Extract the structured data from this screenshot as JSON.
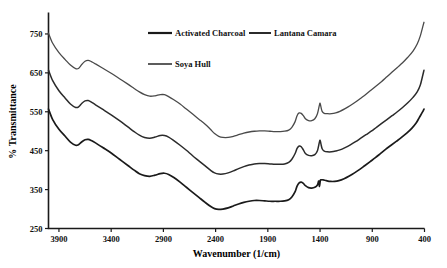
{
  "chart_data": {
    "type": "line",
    "title": "",
    "xlabel": "Wavenumber (1/cm)",
    "ylabel": "% Transmittance",
    "xlim": [
      4000,
      400
    ],
    "ylim": [
      250,
      800
    ],
    "x_ticks": [
      3900,
      3400,
      2900,
      2400,
      1900,
      1400,
      900,
      400
    ],
    "y_ticks": [
      250,
      350,
      450,
      550,
      650,
      750
    ],
    "grid": false,
    "x_axis_direction": "descending",
    "legend_position": "top-center",
    "series": [
      {
        "name": "Activated Charcoal",
        "color": "#1a1a1a",
        "stroke_width": 1.7,
        "points": [
          [
            4000,
            557
          ],
          [
            3960,
            530
          ],
          [
            3900,
            505
          ],
          [
            3840,
            487
          ],
          [
            3790,
            472
          ],
          [
            3740,
            464
          ],
          [
            3710,
            466
          ],
          [
            3680,
            473
          ],
          [
            3650,
            478
          ],
          [
            3620,
            479
          ],
          [
            3590,
            476
          ],
          [
            3550,
            470
          ],
          [
            3480,
            458
          ],
          [
            3400,
            444
          ],
          [
            3320,
            428
          ],
          [
            3240,
            412
          ],
          [
            3180,
            400
          ],
          [
            3130,
            391
          ],
          [
            3080,
            386
          ],
          [
            3030,
            384
          ],
          [
            2980,
            387
          ],
          [
            2930,
            391
          ],
          [
            2890,
            392
          ],
          [
            2850,
            389
          ],
          [
            2800,
            381
          ],
          [
            2740,
            369
          ],
          [
            2680,
            356
          ],
          [
            2620,
            343
          ],
          [
            2560,
            330
          ],
          [
            2500,
            317
          ],
          [
            2450,
            307
          ],
          [
            2410,
            301
          ],
          [
            2370,
            299
          ],
          [
            2330,
            300
          ],
          [
            2280,
            303
          ],
          [
            2230,
            308
          ],
          [
            2180,
            313
          ],
          [
            2130,
            317
          ],
          [
            2080,
            320
          ],
          [
            2030,
            322
          ],
          [
            1980,
            322
          ],
          [
            1930,
            321
          ],
          [
            1880,
            320
          ],
          [
            1830,
            320
          ],
          [
            1780,
            320
          ],
          [
            1740,
            321
          ],
          [
            1700,
            324
          ],
          [
            1670,
            331
          ],
          [
            1640,
            344
          ],
          [
            1620,
            359
          ],
          [
            1600,
            367
          ],
          [
            1580,
            369
          ],
          [
            1560,
            366
          ],
          [
            1540,
            360
          ],
          [
            1510,
            355
          ],
          [
            1480,
            354
          ],
          [
            1450,
            356
          ],
          [
            1425,
            362
          ],
          [
            1412,
            372
          ],
          [
            1405,
            358
          ],
          [
            1398,
            373
          ],
          [
            1390,
            375
          ],
          [
            1370,
            375
          ],
          [
            1340,
            373
          ],
          [
            1300,
            371
          ],
          [
            1260,
            371
          ],
          [
            1220,
            373
          ],
          [
            1170,
            378
          ],
          [
            1120,
            385
          ],
          [
            1070,
            393
          ],
          [
            1020,
            402
          ],
          [
            970,
            412
          ],
          [
            920,
            422
          ],
          [
            870,
            432
          ],
          [
            820,
            443
          ],
          [
            770,
            454
          ],
          [
            720,
            464
          ],
          [
            670,
            474
          ],
          [
            620,
            484
          ],
          [
            570,
            495
          ],
          [
            520,
            508
          ],
          [
            480,
            521
          ],
          [
            450,
            535
          ],
          [
            420,
            549
          ],
          [
            405,
            557
          ]
        ]
      },
      {
        "name": "Lantana Camara",
        "color": "#2b2b2b",
        "stroke_width": 1.5,
        "points": [
          [
            4000,
            657
          ],
          [
            3960,
            630
          ],
          [
            3900,
            604
          ],
          [
            3840,
            585
          ],
          [
            3790,
            570
          ],
          [
            3740,
            561
          ],
          [
            3710,
            563
          ],
          [
            3680,
            572
          ],
          [
            3650,
            578
          ],
          [
            3620,
            579
          ],
          [
            3590,
            575
          ],
          [
            3550,
            568
          ],
          [
            3480,
            556
          ],
          [
            3400,
            542
          ],
          [
            3320,
            527
          ],
          [
            3240,
            511
          ],
          [
            3180,
            499
          ],
          [
            3130,
            490
          ],
          [
            3080,
            484
          ],
          [
            3030,
            482
          ],
          [
            2980,
            485
          ],
          [
            2930,
            489
          ],
          [
            2890,
            489
          ],
          [
            2850,
            485
          ],
          [
            2800,
            476
          ],
          [
            2740,
            464
          ],
          [
            2680,
            451
          ],
          [
            2620,
            437
          ],
          [
            2560,
            424
          ],
          [
            2500,
            411
          ],
          [
            2450,
            400
          ],
          [
            2410,
            393
          ],
          [
            2370,
            390
          ],
          [
            2330,
            390
          ],
          [
            2280,
            393
          ],
          [
            2230,
            398
          ],
          [
            2180,
            404
          ],
          [
            2130,
            409
          ],
          [
            2080,
            413
          ],
          [
            2030,
            416
          ],
          [
            1980,
            417
          ],
          [
            1930,
            417
          ],
          [
            1880,
            416
          ],
          [
            1830,
            415
          ],
          [
            1780,
            415
          ],
          [
            1740,
            416
          ],
          [
            1700,
            420
          ],
          [
            1670,
            428
          ],
          [
            1640,
            442
          ],
          [
            1620,
            456
          ],
          [
            1600,
            462
          ],
          [
            1580,
            460
          ],
          [
            1560,
            452
          ],
          [
            1540,
            443
          ],
          [
            1510,
            438
          ],
          [
            1480,
            437
          ],
          [
            1450,
            440
          ],
          [
            1425,
            450
          ],
          [
            1408,
            470
          ],
          [
            1400,
            477
          ],
          [
            1392,
            468
          ],
          [
            1380,
            455
          ],
          [
            1360,
            449
          ],
          [
            1330,
            447
          ],
          [
            1290,
            447
          ],
          [
            1250,
            449
          ],
          [
            1210,
            452
          ],
          [
            1160,
            458
          ],
          [
            1110,
            465
          ],
          [
            1060,
            473
          ],
          [
            1010,
            482
          ],
          [
            960,
            491
          ],
          [
            910,
            500
          ],
          [
            860,
            510
          ],
          [
            810,
            520
          ],
          [
            760,
            530
          ],
          [
            710,
            540
          ],
          [
            660,
            550
          ],
          [
            610,
            561
          ],
          [
            560,
            573
          ],
          [
            510,
            587
          ],
          [
            470,
            601
          ],
          [
            440,
            619
          ],
          [
            420,
            640
          ],
          [
            405,
            657
          ]
        ]
      },
      {
        "name": "Soya Hull",
        "color": "#4a4a4a",
        "stroke_width": 1.3,
        "points": [
          [
            4000,
            752
          ],
          [
            3960,
            726
          ],
          [
            3900,
            702
          ],
          [
            3840,
            684
          ],
          [
            3790,
            670
          ],
          [
            3740,
            661
          ],
          [
            3710,
            662
          ],
          [
            3680,
            672
          ],
          [
            3650,
            680
          ],
          [
            3620,
            682
          ],
          [
            3590,
            679
          ],
          [
            3550,
            673
          ],
          [
            3480,
            662
          ],
          [
            3400,
            649
          ],
          [
            3320,
            635
          ],
          [
            3240,
            621
          ],
          [
            3180,
            610
          ],
          [
            3130,
            601
          ],
          [
            3080,
            594
          ],
          [
            3030,
            590
          ],
          [
            2980,
            591
          ],
          [
            2930,
            594
          ],
          [
            2890,
            594
          ],
          [
            2850,
            589
          ],
          [
            2800,
            581
          ],
          [
            2740,
            570
          ],
          [
            2680,
            557
          ],
          [
            2620,
            544
          ],
          [
            2560,
            531
          ],
          [
            2500,
            518
          ],
          [
            2450,
            505
          ],
          [
            2410,
            494
          ],
          [
            2370,
            487
          ],
          [
            2330,
            484
          ],
          [
            2280,
            484
          ],
          [
            2230,
            487
          ],
          [
            2180,
            491
          ],
          [
            2130,
            495
          ],
          [
            2080,
            498
          ],
          [
            2030,
            500
          ],
          [
            1980,
            501
          ],
          [
            1930,
            501
          ],
          [
            1880,
            500
          ],
          [
            1830,
            499
          ],
          [
            1780,
            499
          ],
          [
            1740,
            500
          ],
          [
            1700,
            503
          ],
          [
            1670,
            510
          ],
          [
            1640,
            524
          ],
          [
            1620,
            540
          ],
          [
            1600,
            547
          ],
          [
            1580,
            546
          ],
          [
            1560,
            540
          ],
          [
            1540,
            532
          ],
          [
            1510,
            527
          ],
          [
            1480,
            527
          ],
          [
            1450,
            532
          ],
          [
            1425,
            545
          ],
          [
            1408,
            565
          ],
          [
            1400,
            572
          ],
          [
            1392,
            563
          ],
          [
            1380,
            551
          ],
          [
            1360,
            546
          ],
          [
            1330,
            545
          ],
          [
            1290,
            545
          ],
          [
            1250,
            547
          ],
          [
            1210,
            551
          ],
          [
            1160,
            558
          ],
          [
            1110,
            566
          ],
          [
            1060,
            575
          ],
          [
            1010,
            585
          ],
          [
            960,
            595
          ],
          [
            910,
            606
          ],
          [
            860,
            617
          ],
          [
            810,
            628
          ],
          [
            760,
            640
          ],
          [
            710,
            652
          ],
          [
            660,
            664
          ],
          [
            610,
            676
          ],
          [
            560,
            690
          ],
          [
            510,
            706
          ],
          [
            470,
            724
          ],
          [
            440,
            745
          ],
          [
            420,
            765
          ],
          [
            405,
            780
          ]
        ]
      }
    ]
  },
  "legend": {
    "items": [
      {
        "label": "Activated Charcoal"
      },
      {
        "label": "Lantana Camara"
      },
      {
        "label": "Soya Hull"
      }
    ]
  },
  "axes": {
    "x_title": "Wavenumber (1/cm)",
    "y_title": "% Transmittance",
    "x_tick_labels": [
      "3900",
      "3400",
      "2900",
      "2400",
      "1900",
      "1400",
      "900",
      "400"
    ],
    "y_tick_labels": [
      "750",
      "650",
      "550",
      "450",
      "350",
      "250"
    ]
  }
}
